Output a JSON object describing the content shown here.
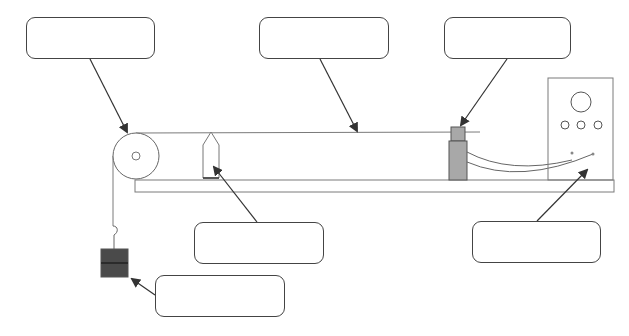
{
  "diagram": {
    "title": "",
    "colors": {
      "stroke": "#444444",
      "thin_stroke": "#7a7a7a",
      "sensor_fill": "#a8a8a8",
      "mass_fill": "#4a4a4a",
      "background": "#ffffff"
    },
    "label_boxes": [
      {
        "id": "pulley-label",
        "text": "",
        "x": 26,
        "y": 17,
        "w": 129,
        "h": 42,
        "points_to": "pulley"
      },
      {
        "id": "string-label",
        "text": "",
        "x": 259,
        "y": 17,
        "w": 130,
        "h": 42,
        "points_to": "string"
      },
      {
        "id": "sensor-label",
        "text": "",
        "x": 444,
        "y": 17,
        "w": 127,
        "h": 42,
        "points_to": "motion-sensor"
      },
      {
        "id": "cart-label",
        "text": "",
        "x": 194,
        "y": 222,
        "w": 130,
        "h": 42,
        "points_to": "cart"
      },
      {
        "id": "interface-label",
        "text": "",
        "x": 472,
        "y": 221,
        "w": 129,
        "h": 42,
        "points_to": "interface-box"
      },
      {
        "id": "mass-label",
        "text": "",
        "x": 155,
        "y": 275,
        "w": 130,
        "h": 42,
        "points_to": "hanging-mass"
      }
    ],
    "components": [
      "pulley",
      "string",
      "cart",
      "track",
      "motion-sensor",
      "cables",
      "interface-box",
      "hanging-mass",
      "hook"
    ]
  }
}
